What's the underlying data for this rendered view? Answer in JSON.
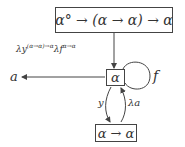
{
  "nodes": {
    "top": {
      "label": "α° → (α → α) → α"
    },
    "alpha": {
      "label": "α"
    },
    "bottom": {
      "label": "α → α"
    }
  },
  "edges": {
    "top_to_alpha": {
      "label_main": "λy",
      "label_sup1": "(α→α)→α",
      "label_mid": "λf",
      "label_sup2": "α→α"
    },
    "alpha_to_a": {
      "target": "a"
    },
    "self_loop": {
      "label": "f"
    },
    "alpha_to_bottom": {
      "label": "y"
    },
    "bottom_to_alpha": {
      "label": "λa"
    }
  }
}
